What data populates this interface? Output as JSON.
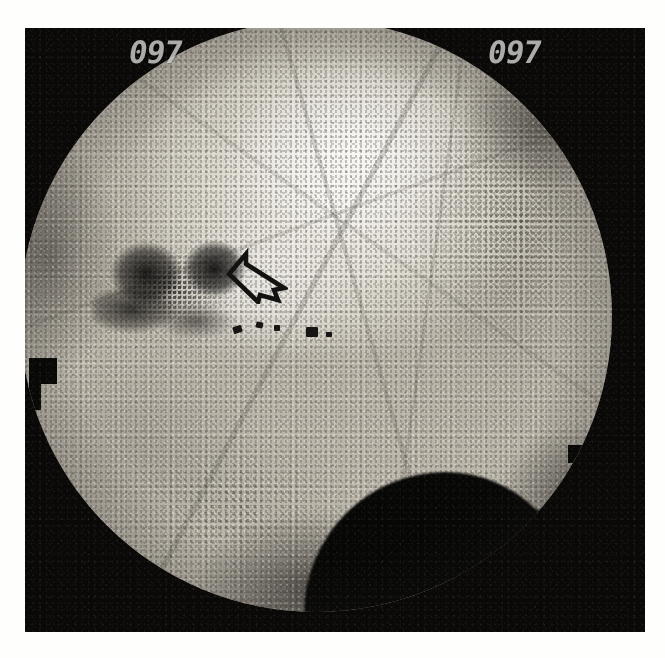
{
  "image": {
    "modality": "fluoroscopic radiograph",
    "view_description": "circular fluoroscopy field on black film background",
    "width_px": 665,
    "height_px": 658
  },
  "overlays": {
    "readout_left": "097",
    "readout_right": "097",
    "readout_description": "seven-segment style digital exposure counter in upper corners"
  },
  "annotations": [
    {
      "name": "open-outline-arrow",
      "label": "",
      "points_to": "radiolucent lesion margin left of midline",
      "direction": "down-left"
    }
  ],
  "features": {
    "lesion_label": "radiolucent dark region",
    "dome_label": "dense dome-shaped structure",
    "markers_label": "small radiodense clips",
    "notch_label": "collimator edge marker"
  },
  "colors": {
    "film_black": "#0a0908",
    "field_bright": "#f2f0ea",
    "field_mid": "#c9c4b8",
    "lesion_dark": "#100f0e",
    "annotation_black": "#111111",
    "readout_gray": "#cfcfcb",
    "page_white": "#fefefd"
  }
}
